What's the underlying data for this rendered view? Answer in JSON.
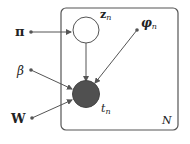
{
  "diagram": {
    "type": "plate-notation-graphical-model",
    "plate": {
      "label": "N"
    },
    "nodes": [
      {
        "id": "z",
        "label_main": "z",
        "label_sub": "n",
        "observed": false
      },
      {
        "id": "t",
        "label_main": "t",
        "label_sub": "n",
        "observed": true
      }
    ],
    "parameters": [
      {
        "id": "pi",
        "label": "π"
      },
      {
        "id": "beta",
        "label": "β"
      },
      {
        "id": "W",
        "label": "W"
      },
      {
        "id": "phi",
        "label_main": "φ",
        "label_sub": "n"
      }
    ],
    "edges": [
      {
        "from": "pi",
        "to": "z"
      },
      {
        "from": "z",
        "to": "t"
      },
      {
        "from": "phi",
        "to": "t"
      },
      {
        "from": "beta",
        "to": "t"
      },
      {
        "from": "W",
        "to": "t"
      }
    ],
    "colors": {
      "line": "#555555",
      "observed_fill": "#505050",
      "latent_fill": "#ffffff",
      "plate_stroke": "#555555"
    }
  }
}
